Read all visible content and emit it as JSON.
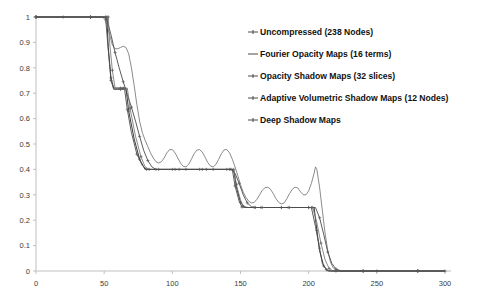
{
  "chart_data": {
    "type": "line",
    "title": "",
    "xlabel": "",
    "ylabel": "",
    "xlim": [
      0,
      300
    ],
    "ylim": [
      0,
      1
    ],
    "xticks": [
      0,
      50,
      100,
      150,
      200,
      250,
      300
    ],
    "yticks": [
      0,
      0.1,
      0.2,
      0.3,
      0.4,
      0.5,
      0.6,
      0.7,
      0.8,
      0.9,
      1
    ],
    "grid": false,
    "legend_position": "right",
    "series": [
      {
        "name": "Uncompressed (238 Nodes)",
        "marker": "plus",
        "points": [
          [
            0,
            1
          ],
          [
            10,
            1
          ],
          [
            20,
            1
          ],
          [
            30,
            1
          ],
          [
            40,
            1
          ],
          [
            50,
            1
          ],
          [
            52,
            1
          ],
          [
            53,
            0.88
          ],
          [
            55,
            0.76
          ],
          [
            57,
            0.72
          ],
          [
            62,
            0.72
          ],
          [
            66,
            0.72
          ],
          [
            68,
            0.63
          ],
          [
            72,
            0.52
          ],
          [
            76,
            0.44
          ],
          [
            80,
            0.4
          ],
          [
            90,
            0.4
          ],
          [
            100,
            0.4
          ],
          [
            110,
            0.4
          ],
          [
            120,
            0.4
          ],
          [
            130,
            0.4
          ],
          [
            140,
            0.4
          ],
          [
            145,
            0.4
          ],
          [
            147,
            0.33
          ],
          [
            150,
            0.27
          ],
          [
            153,
            0.25
          ],
          [
            160,
            0.25
          ],
          [
            170,
            0.25
          ],
          [
            180,
            0.25
          ],
          [
            190,
            0.25
          ],
          [
            200,
            0.25
          ],
          [
            204,
            0.25
          ],
          [
            206,
            0.16
          ],
          [
            208,
            0.08
          ],
          [
            211,
            0.02
          ],
          [
            214,
            0
          ],
          [
            220,
            0
          ],
          [
            235,
            0
          ],
          [
            250,
            0
          ],
          [
            265,
            0
          ],
          [
            280,
            0
          ],
          [
            295,
            0
          ],
          [
            300,
            0
          ]
        ]
      },
      {
        "name": "Fourier Opacity Maps (16 terms)",
        "marker": "none",
        "points": [
          [
            0,
            1
          ],
          [
            20,
            1
          ],
          [
            40,
            1
          ],
          [
            48,
            1
          ],
          [
            50,
            0.995
          ],
          [
            52,
            0.97
          ],
          [
            54,
            0.93
          ],
          [
            56,
            0.89
          ],
          [
            58,
            0.875
          ],
          [
            60,
            0.875
          ],
          [
            62,
            0.88
          ],
          [
            64,
            0.885
          ],
          [
            66,
            0.88
          ],
          [
            68,
            0.855
          ],
          [
            70,
            0.8
          ],
          [
            72,
            0.73
          ],
          [
            74,
            0.655
          ],
          [
            76,
            0.59
          ],
          [
            78,
            0.545
          ],
          [
            80,
            0.515
          ],
          [
            82,
            0.49
          ],
          [
            84,
            0.465
          ],
          [
            86,
            0.445
          ],
          [
            88,
            0.43
          ],
          [
            90,
            0.425
          ],
          [
            92,
            0.43
          ],
          [
            94,
            0.445
          ],
          [
            96,
            0.465
          ],
          [
            98,
            0.478
          ],
          [
            100,
            0.478
          ],
          [
            102,
            0.465
          ],
          [
            104,
            0.445
          ],
          [
            106,
            0.425
          ],
          [
            108,
            0.412
          ],
          [
            110,
            0.41
          ],
          [
            112,
            0.42
          ],
          [
            114,
            0.44
          ],
          [
            116,
            0.462
          ],
          [
            118,
            0.476
          ],
          [
            120,
            0.478
          ],
          [
            122,
            0.468
          ],
          [
            124,
            0.448
          ],
          [
            126,
            0.427
          ],
          [
            128,
            0.413
          ],
          [
            130,
            0.41
          ],
          [
            132,
            0.42
          ],
          [
            134,
            0.44
          ],
          [
            136,
            0.462
          ],
          [
            138,
            0.477
          ],
          [
            140,
            0.478
          ],
          [
            142,
            0.465
          ],
          [
            144,
            0.44
          ],
          [
            146,
            0.41
          ],
          [
            148,
            0.375
          ],
          [
            150,
            0.34
          ],
          [
            152,
            0.31
          ],
          [
            154,
            0.29
          ],
          [
            156,
            0.275
          ],
          [
            158,
            0.268
          ],
          [
            160,
            0.27
          ],
          [
            162,
            0.282
          ],
          [
            164,
            0.3
          ],
          [
            166,
            0.318
          ],
          [
            168,
            0.328
          ],
          [
            170,
            0.33
          ],
          [
            172,
            0.322
          ],
          [
            174,
            0.305
          ],
          [
            176,
            0.285
          ],
          [
            178,
            0.27
          ],
          [
            180,
            0.264
          ],
          [
            182,
            0.268
          ],
          [
            184,
            0.285
          ],
          [
            186,
            0.305
          ],
          [
            188,
            0.322
          ],
          [
            190,
            0.33
          ],
          [
            192,
            0.327
          ],
          [
            194,
            0.312
          ],
          [
            196,
            0.3
          ],
          [
            198,
            0.3
          ],
          [
            200,
            0.315
          ],
          [
            202,
            0.345
          ],
          [
            204,
            0.385
          ],
          [
            205,
            0.41
          ],
          [
            206,
            0.4
          ],
          [
            208,
            0.33
          ],
          [
            210,
            0.24
          ],
          [
            212,
            0.15
          ],
          [
            214,
            0.08
          ],
          [
            216,
            0.035
          ],
          [
            218,
            0.012
          ],
          [
            220,
            0.004
          ],
          [
            224,
            0
          ],
          [
            240,
            0
          ],
          [
            260,
            0
          ],
          [
            280,
            0
          ],
          [
            300,
            0
          ]
        ]
      },
      {
        "name": "Opacity Shadow Maps (32 slices)",
        "marker": "plus",
        "points": [
          [
            0,
            1
          ],
          [
            20,
            1
          ],
          [
            40,
            1
          ],
          [
            50,
            1
          ],
          [
            52,
            0.99
          ],
          [
            55,
            0.93
          ],
          [
            58,
            0.86
          ],
          [
            61,
            0.8
          ],
          [
            64,
            0.745
          ],
          [
            67,
            0.695
          ],
          [
            70,
            0.645
          ],
          [
            73,
            0.59
          ],
          [
            76,
            0.53
          ],
          [
            79,
            0.475
          ],
          [
            82,
            0.435
          ],
          [
            85,
            0.41
          ],
          [
            88,
            0.4
          ],
          [
            95,
            0.4
          ],
          [
            105,
            0.4
          ],
          [
            115,
            0.4
          ],
          [
            125,
            0.4
          ],
          [
            135,
            0.4
          ],
          [
            143,
            0.4
          ],
          [
            146,
            0.385
          ],
          [
            149,
            0.345
          ],
          [
            152,
            0.3
          ],
          [
            155,
            0.268
          ],
          [
            158,
            0.253
          ],
          [
            161,
            0.25
          ],
          [
            170,
            0.25
          ],
          [
            180,
            0.25
          ],
          [
            190,
            0.25
          ],
          [
            200,
            0.25
          ],
          [
            205,
            0.25
          ],
          [
            208,
            0.21
          ],
          [
            211,
            0.145
          ],
          [
            214,
            0.075
          ],
          [
            217,
            0.03
          ],
          [
            220,
            0.008
          ],
          [
            224,
            0
          ],
          [
            240,
            0
          ],
          [
            260,
            0
          ],
          [
            280,
            0
          ],
          [
            300,
            0
          ]
        ]
      },
      {
        "name": "Adaptive Volumetric Shadow Maps (12 Nodes)",
        "marker": "plus",
        "points": [
          [
            0,
            1
          ],
          [
            20,
            1
          ],
          [
            40,
            1
          ],
          [
            50,
            1
          ],
          [
            53,
            1
          ],
          [
            54,
            0.9
          ],
          [
            56,
            0.79
          ],
          [
            58,
            0.72
          ],
          [
            64,
            0.72
          ],
          [
            67,
            0.72
          ],
          [
            69,
            0.64
          ],
          [
            73,
            0.53
          ],
          [
            77,
            0.45
          ],
          [
            80,
            0.41
          ],
          [
            83,
            0.4
          ],
          [
            92,
            0.4
          ],
          [
            102,
            0.4
          ],
          [
            112,
            0.4
          ],
          [
            122,
            0.4
          ],
          [
            132,
            0.4
          ],
          [
            142,
            0.4
          ],
          [
            145,
            0.4
          ],
          [
            147,
            0.34
          ],
          [
            150,
            0.28
          ],
          [
            152,
            0.255
          ],
          [
            155,
            0.25
          ],
          [
            165,
            0.25
          ],
          [
            175,
            0.25
          ],
          [
            185,
            0.25
          ],
          [
            195,
            0.25
          ],
          [
            203,
            0.25
          ],
          [
            206,
            0.19
          ],
          [
            209,
            0.11
          ],
          [
            212,
            0.045
          ],
          [
            215,
            0.01
          ],
          [
            218,
            0
          ],
          [
            240,
            0
          ],
          [
            260,
            0
          ],
          [
            280,
            0
          ],
          [
            300,
            0
          ]
        ]
      },
      {
        "name": "Deep Shadow Maps",
        "marker": "plus",
        "points": [
          [
            0,
            1
          ],
          [
            20,
            1
          ],
          [
            40,
            1
          ],
          [
            50,
            1
          ],
          [
            51,
            1
          ],
          [
            53,
            0.87
          ],
          [
            55,
            0.75
          ],
          [
            57,
            0.715
          ],
          [
            62,
            0.715
          ],
          [
            65,
            0.715
          ],
          [
            67,
            0.635
          ],
          [
            70,
            0.545
          ],
          [
            74,
            0.46
          ],
          [
            78,
            0.415
          ],
          [
            81,
            0.4
          ],
          [
            90,
            0.4
          ],
          [
            100,
            0.4
          ],
          [
            110,
            0.4
          ],
          [
            120,
            0.4
          ],
          [
            130,
            0.4
          ],
          [
            140,
            0.4
          ],
          [
            144,
            0.4
          ],
          [
            146,
            0.335
          ],
          [
            149,
            0.275
          ],
          [
            151,
            0.252
          ],
          [
            156,
            0.25
          ],
          [
            166,
            0.25
          ],
          [
            176,
            0.25
          ],
          [
            186,
            0.25
          ],
          [
            196,
            0.25
          ],
          [
            202,
            0.25
          ],
          [
            205,
            0.175
          ],
          [
            208,
            0.09
          ],
          [
            210,
            0.03
          ],
          [
            213,
            0.005
          ],
          [
            216,
            0
          ],
          [
            240,
            0
          ],
          [
            260,
            0
          ],
          [
            280,
            0
          ],
          [
            300,
            0
          ]
        ]
      }
    ],
    "legend": [
      {
        "label": "Uncompressed (238 Nodes)",
        "marker": "plus-line"
      },
      {
        "label": "Fourier Opacity Maps (16 terms)",
        "marker": "line"
      },
      {
        "label": "Opacity Shadow Maps (32 slices)",
        "marker": "plus-line"
      },
      {
        "label": "Adaptive Volumetric Shadow Maps (12 Nodes)",
        "marker": "plus-line"
      },
      {
        "label": "Deep Shadow Maps",
        "marker": "plus-line"
      }
    ],
    "colors": {
      "series_stroke": "#4a4a4a",
      "axis": "#bfbfbf",
      "text": "#111111"
    }
  }
}
